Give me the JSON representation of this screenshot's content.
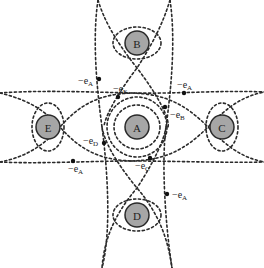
{
  "diagram": {
    "type": "atomic-lattice-bond-vectors",
    "colors": {
      "atom_fill": "#a6a6a6",
      "atom_stroke": "#2a2a2a",
      "line": "#2a2a2a",
      "text": "#222222",
      "background": "#ffffff"
    },
    "atoms": [
      {
        "id": "A",
        "label": "A",
        "position": "center"
      },
      {
        "id": "B",
        "label": "B",
        "position": "top"
      },
      {
        "id": "C",
        "label": "C",
        "position": "right"
      },
      {
        "id": "D",
        "label": "D",
        "position": "bottom"
      },
      {
        "id": "E",
        "label": "E",
        "position": "left"
      }
    ],
    "vectors": [
      {
        "prefix": "−e",
        "sub": "A",
        "location": "upper-left, on vertical boundary above A"
      },
      {
        "prefix": "−e",
        "sub": "E",
        "location": "upper-left of A"
      },
      {
        "prefix": "−e",
        "sub": "A",
        "location": "upper-right, on horizontal boundary"
      },
      {
        "prefix": "−e",
        "sub": "B",
        "location": "upper-right of A"
      },
      {
        "prefix": "−e",
        "sub": "D",
        "location": "lower-left of A"
      },
      {
        "prefix": "−e",
        "sub": "A",
        "location": "lower-left, on horizontal boundary"
      },
      {
        "prefix": "−e",
        "sub": "C",
        "location": "lower-right of A"
      },
      {
        "prefix": "−e",
        "sub": "A",
        "location": "lower-right, on vertical boundary below A"
      }
    ]
  }
}
